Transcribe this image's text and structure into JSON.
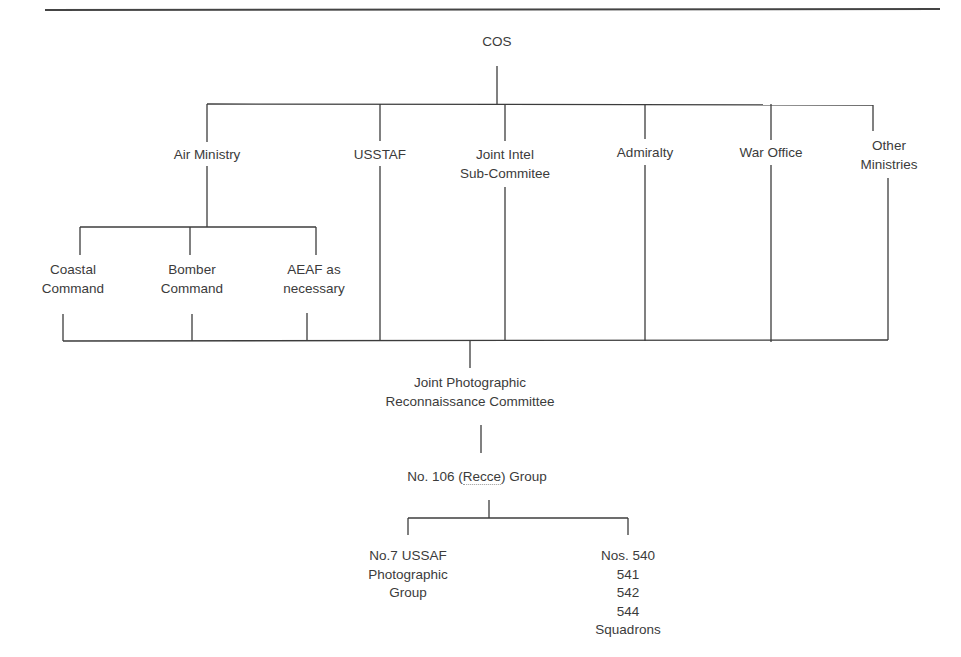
{
  "diagram": {
    "root": {
      "id": "cos",
      "label": "COS"
    },
    "level1": [
      {
        "id": "air-ministry",
        "lines": [
          "Air Ministry"
        ]
      },
      {
        "id": "usstaf",
        "lines": [
          "USSTAF"
        ]
      },
      {
        "id": "joint-intel",
        "lines": [
          "Joint Intel",
          "Sub-Commitee"
        ]
      },
      {
        "id": "admiralty",
        "lines": [
          "Admiralty"
        ]
      },
      {
        "id": "war-office",
        "lines": [
          "War Office"
        ]
      },
      {
        "id": "other-ministries",
        "lines": [
          "Other",
          "Ministries"
        ]
      }
    ],
    "air_ministry_children": [
      {
        "id": "coastal-command",
        "lines": [
          "Coastal",
          "Command"
        ]
      },
      {
        "id": "bomber-command",
        "lines": [
          "Bomber",
          "Command"
        ]
      },
      {
        "id": "aeaf",
        "lines": [
          "AEAF as",
          "necessary"
        ]
      }
    ],
    "jprc": {
      "id": "jprc",
      "lines": [
        "Joint Photographic",
        "Reconnaissance Committee"
      ]
    },
    "group": {
      "id": "no-106-group",
      "prefix": "No. 106 (",
      "highlight": "Recce",
      "suffix": ") Group"
    },
    "group_children": [
      {
        "id": "no7-usaaf",
        "lines": [
          "No.7 USSAF",
          "Photographic",
          "Group"
        ]
      },
      {
        "id": "squadrons",
        "lines": [
          "Nos. 540",
          "541",
          "542",
          "544",
          "Squadrons"
        ]
      }
    ],
    "edges": [
      [
        "COS",
        "Air Ministry"
      ],
      [
        "COS",
        "USSTAF"
      ],
      [
        "COS",
        "Joint Intel Sub-Commitee"
      ],
      [
        "COS",
        "Admiralty"
      ],
      [
        "COS",
        "War Office"
      ],
      [
        "COS",
        "Other Ministries"
      ],
      [
        "Air Ministry",
        "Coastal Command"
      ],
      [
        "Air Ministry",
        "Bomber Command"
      ],
      [
        "Air Ministry",
        "AEAF as necessary"
      ],
      [
        "Coastal Command",
        "Joint Photographic Reconnaissance Committee"
      ],
      [
        "Bomber Command",
        "Joint Photographic Reconnaissance Committee"
      ],
      [
        "AEAF as necessary",
        "Joint Photographic Reconnaissance Committee"
      ],
      [
        "USSTAF",
        "Joint Photographic Reconnaissance Committee"
      ],
      [
        "Joint Intel Sub-Commitee",
        "Joint Photographic Reconnaissance Committee"
      ],
      [
        "Admiralty",
        "Joint Photographic Reconnaissance Committee"
      ],
      [
        "War Office",
        "Joint Photographic Reconnaissance Committee"
      ],
      [
        "Other Ministries",
        "Joint Photographic Reconnaissance Committee"
      ],
      [
        "Joint Photographic Reconnaissance Committee",
        "No. 106 (Recce) Group"
      ],
      [
        "No. 106 (Recce) Group",
        "No.7 USSAF Photographic Group"
      ],
      [
        "No. 106 (Recce) Group",
        "Nos. 540 541 542 544 Squadrons"
      ]
    ]
  }
}
